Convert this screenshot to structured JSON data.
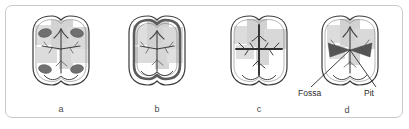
{
  "figure": {
    "caption_letters": [
      "a",
      "b",
      "c",
      "d"
    ],
    "annotation_labels": [
      "Fossa",
      "Pit"
    ],
    "colors": {
      "frame_border": "#c9c9c9",
      "background": "#ffffff",
      "outline": "#3a3a3a",
      "groove": "#444444",
      "pit_fill": "#6d6d6d",
      "fossa_fill": "#555555",
      "shade_light": "#dcdcdc",
      "shade_mid": "#cfcfcf",
      "ridge_ring": "#5a5a5a",
      "caption_text": "#4a4a4a",
      "label_text": "#2b2b2b"
    }
  },
  "panels": [
    {
      "id": "a",
      "letter": "a",
      "description": "Occlusal view of molar with four dark oval pits at cusp corners",
      "feature": "pits",
      "pit_count": 4
    },
    {
      "id": "b",
      "letter": "b",
      "description": "Occlusal view of molar with thick dark marginal ridge ring",
      "feature": "marginal-ridge",
      "pit_count": 0
    },
    {
      "id": "c",
      "letter": "c",
      "description": "Occlusal view of molar with prominent central developmental groove",
      "feature": "central-groove",
      "pit_count": 0
    },
    {
      "id": "d",
      "letter": "d",
      "description": "Occlusal view of molar with labeled fossa and pit",
      "feature": "fossa-and-pit",
      "pit_count": 0,
      "labels": {
        "left": "Fossa",
        "right": "Pit"
      }
    }
  ]
}
